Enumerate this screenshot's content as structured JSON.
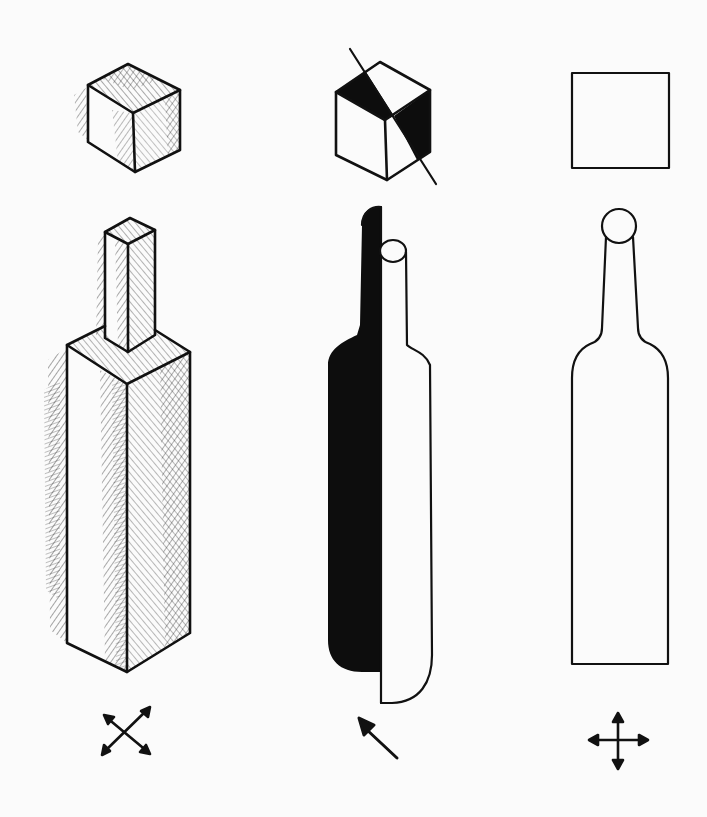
{
  "figure": {
    "colors": {
      "ink": "#111111",
      "paper": "#fbfbfb",
      "shadow": "#0d0d0d"
    },
    "columns": [
      {
        "id": "hatched",
        "objects": [
          "isometric-cube-hatched",
          "square-bottle-hatched"
        ],
        "symbol": "four-diagonal-arrows-icon"
      },
      {
        "id": "light-shadow",
        "objects": [
          "cube-with-shadow-dividing-line",
          "round-bottle-half-shadow"
        ],
        "symbol": "single-diagonal-arrow-icon"
      },
      {
        "id": "outline",
        "objects": [
          "flat-square-outline",
          "bottle-silhouette-outline"
        ],
        "symbol": "four-orthogonal-arrows-icon"
      }
    ]
  }
}
